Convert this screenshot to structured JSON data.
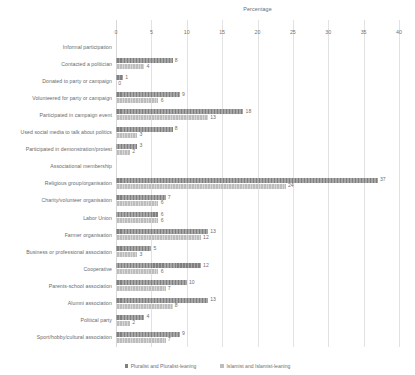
{
  "chart_data": {
    "type": "bar",
    "orientation": "horizontal",
    "title": "",
    "xlabel": "Percentage",
    "ylabel": "",
    "xlim": [
      0,
      40
    ],
    "xticks": [
      0,
      5,
      10,
      15,
      20,
      25,
      30,
      35,
      40
    ],
    "grid": true,
    "legend_position": "bottom",
    "series": [
      {
        "name": "Pluralist and Pluralist-leaning",
        "color": "#808080",
        "values": [
          null,
          8,
          1,
          9,
          18,
          8,
          3,
          null,
          37,
          7,
          6,
          13,
          5,
          12,
          10,
          13,
          4,
          9
        ]
      },
      {
        "name": "Islamist and Islamist-leaning",
        "color": "#bdbdbd",
        "values": [
          null,
          4,
          0,
          6,
          13,
          3,
          2,
          null,
          24,
          6,
          6,
          12,
          3,
          6,
          7,
          8,
          2,
          7
        ]
      }
    ],
    "categories": [
      "Informal participation",
      "Contacted a politician",
      "Donated to party or campaign",
      "Volunteered for party or campaign",
      "Participated in campaign event",
      "Used social media to talk about politics",
      "Participated in demonstration/protest",
      "Associational membership",
      "Religious group/organisation",
      "Charity/volunteer organisation",
      "Labor Union",
      "Farmer organisation",
      "Business or professional association",
      "Cooperative",
      "Parents-school association",
      "Alumni association",
      "Political party",
      "Sport/hobby/cultural association"
    ],
    "group_headers": [
      0,
      7
    ]
  }
}
